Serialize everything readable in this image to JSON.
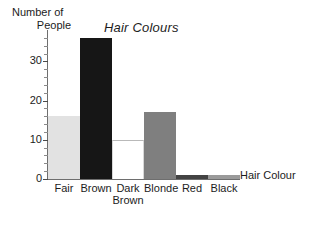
{
  "chart_data": {
    "type": "bar",
    "title": "Hair Colours",
    "xlabel": "Hair Colour",
    "ylabel": "Number of People",
    "ylabel_line1": "Number of",
    "ylabel_line2": "People",
    "categories": [
      "Fair",
      "Brown",
      "Dark Brown",
      "Blonde",
      "Red",
      "Black"
    ],
    "category_labels": [
      {
        "line1": "Fair",
        "line2": ""
      },
      {
        "line1": "Brown",
        "line2": ""
      },
      {
        "line1": "Dark",
        "line2": "Brown"
      },
      {
        "line1": "Blonde",
        "line2": ""
      },
      {
        "line1": "Red",
        "line2": ""
      },
      {
        "line1": "Black",
        "line2": ""
      }
    ],
    "values": [
      16,
      36,
      10,
      17,
      1,
      1
    ],
    "bar_colors": [
      "#e2e2e2",
      "#161616",
      "#ffffff",
      "#7f7f7f",
      "#434343",
      "#9a9a9a"
    ],
    "ylim": [
      0,
      38
    ],
    "yticks": [
      0,
      10,
      20,
      30
    ],
    "ytick_labels": [
      "0",
      "10",
      "20",
      "30"
    ],
    "yminor_step": 2,
    "grid": false,
    "legend": "none"
  },
  "axis": {
    "tick_0": "0",
    "tick_10": "10",
    "tick_20": "20",
    "tick_30": "30"
  }
}
